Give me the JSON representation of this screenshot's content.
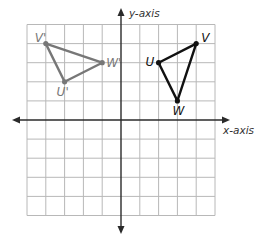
{
  "diagram": {
    "type": "coordinate-plane",
    "x_axis_label": "x-axis",
    "y_axis_label": "y-axis",
    "x_range": [
      -5,
      5
    ],
    "y_range": [
      -5,
      5
    ],
    "grid_step": 1,
    "triangles": [
      {
        "name": "UVW",
        "color": "#111111",
        "vertices": [
          {
            "label": "U",
            "x": 2,
            "y": 3
          },
          {
            "label": "V",
            "x": 4,
            "y": 4
          },
          {
            "label": "W",
            "x": 3,
            "y": 1
          }
        ]
      },
      {
        "name": "U'V'W'",
        "color": "#777777",
        "vertices": [
          {
            "label": "U'",
            "x": -3,
            "y": 2
          },
          {
            "label": "V'",
            "x": -4,
            "y": 4
          },
          {
            "label": "W'",
            "x": -1,
            "y": 3
          }
        ]
      }
    ]
  }
}
